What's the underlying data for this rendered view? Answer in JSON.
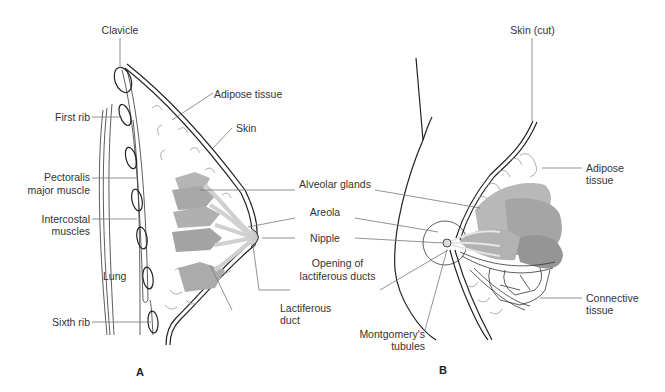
{
  "figure": {
    "panels": [
      {
        "id": "A",
        "label": "A",
        "title": "Sagittal section of breast",
        "labels": {
          "clavicle": "Clavicle",
          "first_rib": "First rib",
          "pectoralis_1": "Pectoralis",
          "pectoralis_2": "major muscle",
          "intercostal_1": "Intercostal",
          "intercostal_2": "muscles",
          "lung": "Lung",
          "sixth_rib": "Sixth rib",
          "adipose": "Adipose tissue",
          "skin": "Skin",
          "lactiferous_duct_1": "Lactiferous",
          "lactiferous_duct_2": "duct"
        }
      },
      {
        "id": "B",
        "label": "B",
        "title": "Anterior view of breast",
        "labels": {
          "skin_cut": "Skin (cut)",
          "adipose_1": "Adipose",
          "adipose_2": "tissue",
          "connective_1": "Connective",
          "connective_2": "tissue",
          "montgomery_1": "Montgomery's",
          "montgomery_2": "tubules"
        }
      }
    ],
    "shared_labels": {
      "alveolar_glands": "Alveolar glands",
      "areola": "Areola",
      "nipple": "Nipple",
      "opening_1": "Opening of",
      "opening_2": "lactiferous ducts"
    },
    "colors": {
      "gland_light": "#b8b8b8",
      "gland_mid": "#a8a8a8",
      "gland_dark": "#989898",
      "outline": "#222222",
      "leader": "#777777"
    }
  }
}
